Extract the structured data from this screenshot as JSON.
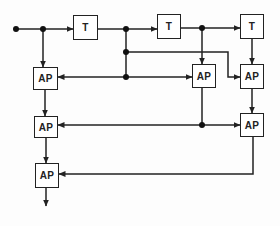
{
  "diagram": {
    "type": "block-diagram",
    "blocks": {
      "t1": {
        "label": "T"
      },
      "t2": {
        "label": "T"
      },
      "t3": {
        "label": "T"
      },
      "ap1": {
        "label": "AP"
      },
      "ap2": {
        "label": "AP"
      },
      "ap3": {
        "label": "AP"
      },
      "ap4": {
        "label": "AP"
      },
      "ap5": {
        "label": "AP"
      },
      "ap6": {
        "label": "AP"
      }
    },
    "connections": [
      {
        "from": "input",
        "to": "t1"
      },
      {
        "from": "input",
        "to": "ap1"
      },
      {
        "from": "t1",
        "to": "t2"
      },
      {
        "from": "t1",
        "to": "ap1"
      },
      {
        "from": "t1",
        "to": "ap2"
      },
      {
        "from": "t1",
        "to": "ap3"
      },
      {
        "from": "t2",
        "to": "t3"
      },
      {
        "from": "t2",
        "to": "ap2"
      },
      {
        "from": "t3",
        "to": "ap3"
      },
      {
        "from": "ap1",
        "to": "ap4"
      },
      {
        "from": "ap2",
        "to": "ap4"
      },
      {
        "from": "ap2",
        "to": "ap5"
      },
      {
        "from": "ap3",
        "to": "ap5"
      },
      {
        "from": "ap4",
        "to": "ap6"
      },
      {
        "from": "ap5",
        "to": "ap6"
      },
      {
        "from": "ap6",
        "to": "output"
      }
    ],
    "colors": {
      "line": "#222222",
      "background": "#ffffff"
    }
  }
}
